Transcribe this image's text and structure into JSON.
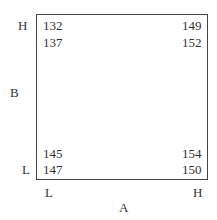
{
  "diagram": {
    "factor_a": {
      "label": "A",
      "low": "L",
      "high": "H"
    },
    "factor_b": {
      "label": "B",
      "low": "L",
      "high": "H"
    },
    "cells": {
      "A_L_B_H": [
        "132",
        "137"
      ],
      "A_H_B_H": [
        "149",
        "152"
      ],
      "A_L_B_L": [
        "145",
        "147"
      ],
      "A_H_B_L": [
        "154",
        "150"
      ]
    }
  }
}
